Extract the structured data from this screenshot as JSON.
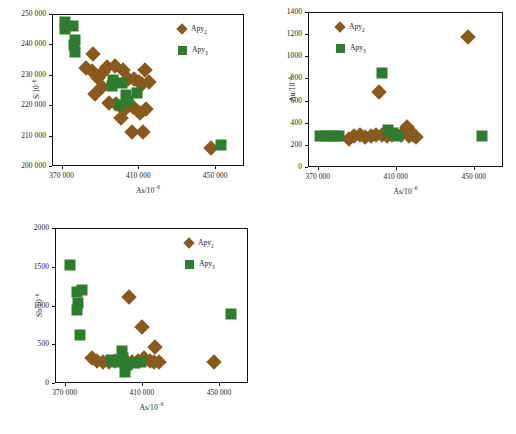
{
  "figure": {
    "series": [
      {
        "key": "apy2",
        "label": "Apy",
        "sub": "2",
        "marker": "diamond",
        "color": "#8a5a1c"
      },
      {
        "key": "apy3",
        "label": "Apy",
        "sub": "3",
        "marker": "square",
        "color": "#2e7d2e"
      }
    ]
  },
  "chart_data": [
    {
      "id": "panel-a",
      "type": "scatter",
      "title": "",
      "xlabel": "As/10-6",
      "ylabel": "S/10-6",
      "xlim": [
        365000,
        465000
      ],
      "ylim": [
        200000,
        250000
      ],
      "xticks": [
        370000,
        410000,
        450000
      ],
      "xticklabels": [
        "370 000",
        "410 000",
        "450 000"
      ],
      "yticks": [
        200000,
        210000,
        220000,
        230000,
        240000,
        250000
      ],
      "yticklabels": [
        "200 000",
        "210 000",
        "220 000",
        "230 000",
        "240 000",
        "250 000"
      ],
      "grid": false,
      "legend_position": "top-right",
      "series": [
        {
          "name": "Apy2",
          "marker": "diamond",
          "color": "#8a5a1c",
          "points": [
            [
              385800,
              237200
            ],
            [
              382300,
              232600
            ],
            [
              385200,
              231600
            ],
            [
              388500,
              229200
            ],
            [
              390800,
              231200
            ],
            [
              393000,
              232800
            ],
            [
              397500,
              233300
            ],
            [
              401500,
              231900
            ],
            [
              404200,
              228900
            ],
            [
              407000,
              229000
            ],
            [
              409600,
              228000
            ],
            [
              413000,
              231800
            ],
            [
              411500,
              227200
            ],
            [
              415200,
              227800
            ],
            [
              386800,
              224000
            ],
            [
              390500,
              226400
            ],
            [
              394200,
              221000
            ],
            [
              398000,
              220800
            ],
            [
              402000,
              218600
            ],
            [
              406500,
              219800
            ],
            [
              410200,
              217600
            ],
            [
              413500,
              219000
            ],
            [
              400500,
              216200
            ],
            [
              406000,
              211400
            ],
            [
              411800,
              211400
            ],
            [
              447500,
              206400
            ]
          ]
        },
        {
          "name": "Apy3",
          "marker": "square",
          "color": "#2e7d2e",
          "points": [
            [
              371200,
              247800
            ],
            [
              371400,
              245400
            ],
            [
              375200,
              246500
            ],
            [
              376500,
              241700
            ],
            [
              375800,
              240200
            ],
            [
              376200,
              237900
            ],
            [
              396000,
              228600
            ],
            [
              395600,
              226800
            ],
            [
              400800,
              227700
            ],
            [
              402800,
              223600
            ],
            [
              404200,
              221800
            ],
            [
              399800,
              220400
            ],
            [
              408800,
              224200
            ],
            [
              452500,
              207300
            ]
          ]
        }
      ]
    },
    {
      "id": "panel-b",
      "type": "scatter",
      "title": "",
      "xlabel": "As/10-6",
      "ylabel": "Au/10-6",
      "xlim": [
        365000,
        465000
      ],
      "ylim": [
        0,
        1400
      ],
      "xticks": [
        370000,
        410000,
        450000
      ],
      "xticklabels": [
        "370 000",
        "410 000",
        "450 000"
      ],
      "yticks": [
        0,
        200,
        400,
        600,
        800,
        1000,
        1200,
        1400
      ],
      "yticklabels": [
        "0",
        "200",
        "400",
        "600",
        "800",
        "1000",
        "1200",
        "1400"
      ],
      "grid": false,
      "legend_position": "top-left",
      "series": [
        {
          "name": "Apy2",
          "marker": "diamond",
          "color": "#8a5a1c",
          "points": [
            [
              385500,
              260
            ],
            [
              388200,
              285
            ],
            [
              391000,
              295
            ],
            [
              393500,
              280
            ],
            [
              396800,
              290
            ],
            [
              399500,
              300
            ],
            [
              402200,
              295
            ],
            [
              404800,
              290
            ],
            [
              407500,
              295
            ],
            [
              412000,
              300
            ],
            [
              415500,
              370
            ],
            [
              417000,
              330
            ],
            [
              418500,
              295
            ],
            [
              420000,
              280
            ],
            [
              416500,
              285
            ],
            [
              400800,
              690
            ],
            [
              446500,
              1180
            ]
          ]
        },
        {
          "name": "Apy3",
          "marker": "square",
          "color": "#2e7d2e",
          "points": [
            [
              370500,
              285
            ],
            [
              373000,
              285
            ],
            [
              375500,
              285
            ],
            [
              378000,
              285
            ],
            [
              380500,
              285
            ],
            [
              405500,
              345
            ],
            [
              408000,
              320
            ],
            [
              410500,
              290
            ],
            [
              402500,
              855
            ],
            [
              453500,
              285
            ]
          ]
        }
      ]
    },
    {
      "id": "panel-c",
      "type": "scatter",
      "title": "",
      "xlabel": "As/10-6",
      "ylabel": "Sb/10-6",
      "xlim": [
        365000,
        465000
      ],
      "ylim": [
        0,
        2000
      ],
      "xticks": [
        370000,
        410000,
        450000
      ],
      "xticklabels": [
        "370 000",
        "410 000",
        "450 000"
      ],
      "yticks": [
        0,
        500,
        1000,
        1500,
        2000
      ],
      "yticklabels": [
        "0",
        "500",
        "1000",
        "1500",
        "2000"
      ],
      "grid": false,
      "legend_position": "top-right",
      "series": [
        {
          "name": "Apy2",
          "marker": "diamond",
          "color": "#8a5a1c",
          "points": [
            [
              383500,
              330
            ],
            [
              386500,
              300
            ],
            [
              389500,
              290
            ],
            [
              392500,
              285
            ],
            [
              395500,
              300
            ],
            [
              398500,
              310
            ],
            [
              401500,
              300
            ],
            [
              404500,
              290
            ],
            [
              407500,
              300
            ],
            [
              410500,
              330
            ],
            [
              413500,
              300
            ],
            [
              416000,
              280
            ],
            [
              418500,
              290
            ],
            [
              403000,
              1125
            ],
            [
              409500,
              730
            ],
            [
              416500,
              480
            ],
            [
              447000,
              280
            ]
          ]
        },
        {
          "name": "Apy3",
          "marker": "square",
          "color": "#2e7d2e",
          "points": [
            [
              372500,
              1530
            ],
            [
              376000,
              1185
            ],
            [
              378500,
              1215
            ],
            [
              376500,
              1050
            ],
            [
              376000,
              960
            ],
            [
              377500,
              630
            ],
            [
              399000,
              430
            ],
            [
              399500,
              330
            ],
            [
              396500,
              290
            ],
            [
              402000,
              250
            ],
            [
              400500,
              160
            ],
            [
              406000,
              265
            ],
            [
              409000,
              290
            ],
            [
              393500,
              310
            ],
            [
              455500,
              905
            ]
          ]
        }
      ]
    }
  ]
}
